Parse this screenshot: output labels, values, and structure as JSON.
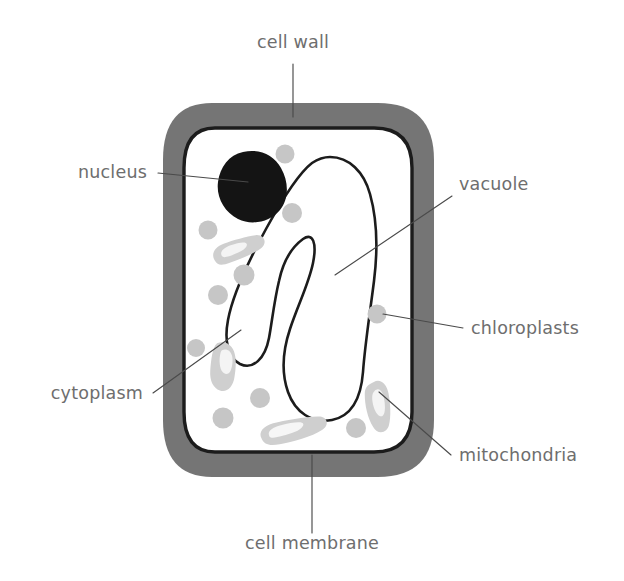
{
  "diagram": {
    "background_color": "#ffffff",
    "colors": {
      "cell_wall": "#757575",
      "cell_membrane": "#1c1c1c",
      "cytoplasm": "#ffffff",
      "nucleus": "#141414",
      "chloroplast": "#c6c6c6",
      "mitochondria_outer": "#cfcfcf",
      "mitochondria_inner": "#f2f2f2",
      "vacuole_outline": "#1c1c1c",
      "vacuole_fill": "#ffffff",
      "label_text": "#6e6e6e",
      "leader_line": "#4a4a4a"
    },
    "labels": [
      {
        "id": "cell-wall",
        "text": "cell wall",
        "x": 293,
        "y": 48,
        "anchor": "middle",
        "leader": "M 293 64 L 293 117"
      },
      {
        "id": "nucleus",
        "text": "nucleus",
        "x": 147,
        "y": 178,
        "anchor": "end",
        "leader": "M 158 173 L 242 181"
      },
      {
        "id": "vacuole",
        "text": "vacuole",
        "x": 459,
        "y": 190,
        "anchor": "start",
        "leader": "M 452 196 L 335 275"
      },
      {
        "id": "chloroplasts",
        "text": "chloroplasts",
        "x": 471,
        "y": 334,
        "anchor": "start",
        "leader": "M 463 328 L 381 314"
      },
      {
        "id": "mitochondria",
        "text": "mitochondria",
        "x": 459,
        "y": 461,
        "anchor": "start",
        "leader": "M 451 455 L 382 392"
      },
      {
        "id": "cytoplasm",
        "text": "cytoplasm",
        "x": 143,
        "y": 399,
        "anchor": "end",
        "leader": "M 153 393 L 241 330"
      },
      {
        "id": "cell-membrane",
        "text": "cell membrane",
        "x": 312,
        "y": 549,
        "anchor": "middle",
        "leader": "M 312 533 L 312 457"
      }
    ],
    "structures": {
      "cell_wall_label": "cell wall",
      "cell_membrane_label": "cell membrane",
      "cytoplasm_label": "cytoplasm",
      "nucleus_label": "nucleus",
      "vacuole_label": "vacuole",
      "chloroplast_label": "chloroplasts",
      "mitochondria_label": "mitochondria"
    },
    "counts": {
      "chloroplasts": 12,
      "mitochondria": 4
    },
    "chloroplasts": [
      {
        "cx": 285,
        "cy": 154,
        "r": 9.5
      },
      {
        "cx": 292,
        "cy": 213,
        "r": 10
      },
      {
        "cx": 208,
        "cy": 230,
        "r": 9.5
      },
      {
        "cx": 244,
        "cy": 275,
        "r": 10.5
      },
      {
        "cx": 218,
        "cy": 295,
        "r": 10
      },
      {
        "cx": 377,
        "cy": 314,
        "r": 9.5
      },
      {
        "cx": 260,
        "cy": 398,
        "r": 10
      },
      {
        "cx": 223,
        "cy": 418,
        "r": 10.5
      },
      {
        "cx": 356,
        "cy": 428,
        "r": 10
      },
      {
        "cx": 196,
        "cy": 348,
        "r": 9
      }
    ],
    "mitochondria": [
      {
        "id": "mito-upper-left",
        "cx": 238,
        "cy": 248,
        "angle": -18
      },
      {
        "id": "mito-mid-left",
        "cx": 231,
        "cy": 368,
        "angle": 8
      },
      {
        "id": "mito-bottom-center",
        "cx": 294,
        "cy": 428,
        "angle": -14
      },
      {
        "id": "mito-right",
        "cx": 377,
        "cy": 404,
        "angle": 72
      }
    ]
  }
}
